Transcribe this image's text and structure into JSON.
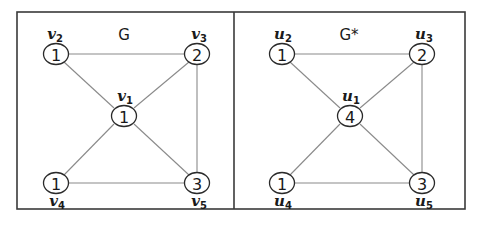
{
  "panels": [
    {
      "title": "G",
      "nodes": [
        {
          "id": "v1",
          "label_base": "v",
          "label_sub": "1",
          "value": "1"
        },
        {
          "id": "v2",
          "label_base": "v",
          "label_sub": "2",
          "value": "1"
        },
        {
          "id": "v3",
          "label_base": "v",
          "label_sub": "3",
          "value": "2"
        },
        {
          "id": "v4",
          "label_base": "v",
          "label_sub": "4",
          "value": "1"
        },
        {
          "id": "v5",
          "label_base": "v",
          "label_sub": "5",
          "value": "3"
        }
      ],
      "edges": [
        [
          "v2",
          "v3"
        ],
        [
          "v2",
          "v1"
        ],
        [
          "v3",
          "v1"
        ],
        [
          "v3",
          "v5"
        ],
        [
          "v1",
          "v4"
        ],
        [
          "v1",
          "v5"
        ],
        [
          "v4",
          "v5"
        ]
      ]
    },
    {
      "title": "G*",
      "nodes": [
        {
          "id": "u1",
          "label_base": "u",
          "label_sub": "1",
          "value": "4"
        },
        {
          "id": "u2",
          "label_base": "u",
          "label_sub": "2",
          "value": "1"
        },
        {
          "id": "u3",
          "label_base": "u",
          "label_sub": "3",
          "value": "2"
        },
        {
          "id": "u4",
          "label_base": "u",
          "label_sub": "4",
          "value": "1"
        },
        {
          "id": "u5",
          "label_base": "u",
          "label_sub": "5",
          "value": "3"
        }
      ],
      "edges": [
        [
          "u2",
          "u3"
        ],
        [
          "u2",
          "u1"
        ],
        [
          "u3",
          "u1"
        ],
        [
          "u3",
          "u5"
        ],
        [
          "u1",
          "u4"
        ],
        [
          "u1",
          "u5"
        ],
        [
          "u4",
          "u5"
        ]
      ]
    }
  ]
}
